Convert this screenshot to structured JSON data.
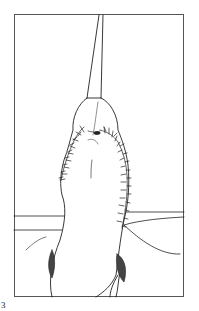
{
  "figure": {
    "label": "3",
    "colors": {
      "line": "#222222",
      "frame": "#555555",
      "shading": "#444444",
      "background": "#ffffff"
    }
  }
}
